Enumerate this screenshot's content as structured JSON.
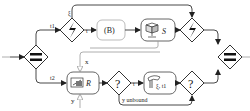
{
  "diagram": {
    "colors": {
      "line": "#333333",
      "light_line": "#999999",
      "fill": "#ffffff"
    },
    "gateways": [
      {
        "id": "split",
        "type": "parallel-split",
        "symbol": "="
      },
      {
        "id": "event1",
        "type": "event-based",
        "symbol": "lightning"
      },
      {
        "id": "event2",
        "type": "event-based",
        "symbol": "lightning"
      },
      {
        "id": "xor1",
        "type": "exclusive",
        "symbol": "?"
      },
      {
        "id": "xor2",
        "type": "exclusive",
        "symbol": "?"
      },
      {
        "id": "join",
        "type": "parallel-join",
        "symbol": "="
      }
    ],
    "tasks": [
      {
        "id": "b",
        "label": "(B)"
      },
      {
        "id": "s",
        "label": "S",
        "icon": "service-icon"
      },
      {
        "id": "r",
        "label": "R",
        "icon": "receive-icon"
      },
      {
        "id": "t",
        "label": "ξ, t1",
        "icon": "script-icon"
      }
    ],
    "edge_labels": {
      "t1": "t1",
      "t2": "t2",
      "xi": "ξ",
      "x": "x",
      "y": "y",
      "y_unbound": "y unbound"
    }
  }
}
